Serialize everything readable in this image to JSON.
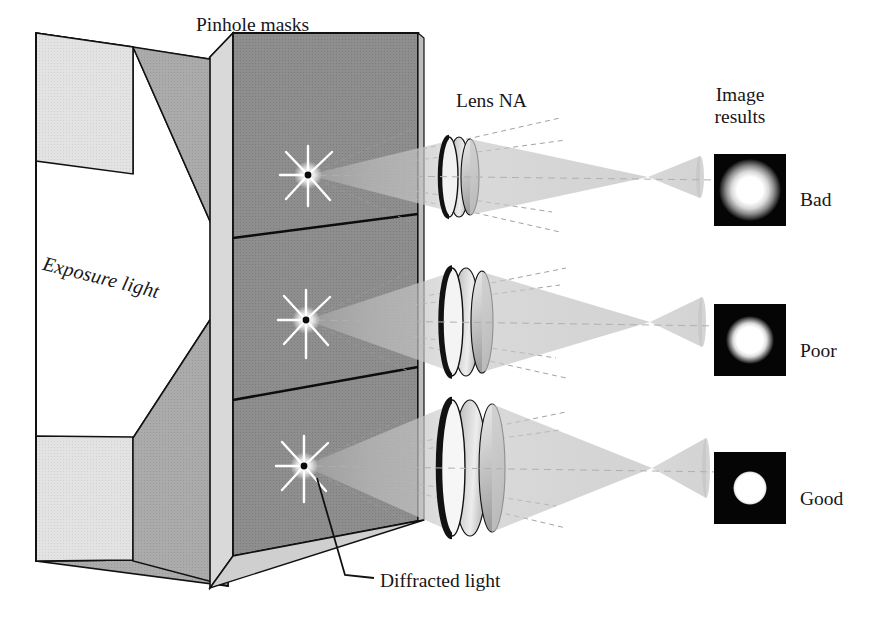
{
  "figure": {
    "title_labels": {
      "pinhole_masks": "Pinhole masks",
      "lens_na": "Lens NA",
      "image_results_line1": "Image",
      "image_results_line2": "results",
      "exposure_light": "Exposure light",
      "diffracted_light": "Diffracted light"
    },
    "rows": [
      {
        "id": "row-bad",
        "quality_label": "Bad",
        "na": "low",
        "spot_radius_px": 31,
        "spot_sharpness": "very-blurred"
      },
      {
        "id": "row-poor",
        "quality_label": "Poor",
        "na": "medium",
        "spot_radius_px": 24,
        "spot_sharpness": "blurred"
      },
      {
        "id": "row-good",
        "quality_label": "Good",
        "na": "high",
        "spot_radius_px": 17,
        "spot_sharpness": "sharp"
      }
    ],
    "colors": {
      "mask_face": "#8a8a8a",
      "mask_edge_light": "#d8d8d8",
      "frame_light": "#e2e2e2",
      "frame_mid": "#a8a8a8",
      "beam_light": "#ffffff",
      "cone_gray": "#b9b9b9",
      "lens_body": "#c4c4c4",
      "lens_rim_dark": "#1a1a1a",
      "spot_box": "#050505",
      "spot_core": "#ffffff",
      "outline": "#111111",
      "text": "#17161a"
    },
    "icon_names": [
      "starburst-flare-icon",
      "lens-icon",
      "light-cone-icon",
      "leader-line-icon",
      "image-spot-icon"
    ]
  }
}
